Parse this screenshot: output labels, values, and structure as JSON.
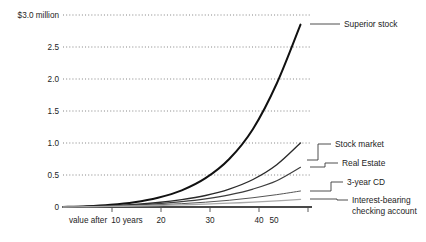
{
  "chart_data": {
    "type": "line",
    "title": "",
    "xlabel": "",
    "ylabel": "",
    "grid": "horizontal-dotted",
    "legend_position": "right-inline-labels",
    "xlim": [
      0,
      52
    ],
    "ylim": [
      0,
      3.0
    ],
    "y_ticks": [
      0,
      0.5,
      1.0,
      1.5,
      2.0,
      2.5,
      3.0
    ],
    "y_tick_labels": [
      "0",
      "0.5",
      "1.0",
      "1.5",
      "2.0",
      "2.5",
      "$3.0 million"
    ],
    "y_unit": "million dollars",
    "x_ticks": [
      10,
      20,
      30,
      40,
      50
    ],
    "x_tick_labels": [
      "10 years",
      "20",
      "30",
      "40",
      "50"
    ],
    "x_first_label_prefix": "value after",
    "x_unit": "years",
    "x": [
      0,
      5,
      10,
      15,
      20,
      25,
      30,
      35,
      40,
      45,
      50
    ],
    "series": [
      {
        "name": "Superior stock",
        "values": [
          0,
          0.012,
          0.035,
          0.075,
          0.145,
          0.26,
          0.45,
          0.75,
          1.22,
          1.93,
          2.85
        ],
        "color": "#111111",
        "width": 2.0
      },
      {
        "name": "Stock market",
        "values": [
          0,
          0.008,
          0.02,
          0.04,
          0.07,
          0.115,
          0.18,
          0.28,
          0.43,
          0.66,
          1.0
        ],
        "color": "#2a2a2a",
        "width": 1.35
      },
      {
        "name": "Real Estate",
        "values": [
          0,
          0.006,
          0.016,
          0.031,
          0.053,
          0.084,
          0.128,
          0.19,
          0.28,
          0.41,
          0.62
        ],
        "color": "#3d3d3d",
        "width": 1.15
      },
      {
        "name": "3-year CD",
        "values": [
          0,
          0.005,
          0.012,
          0.022,
          0.035,
          0.052,
          0.075,
          0.105,
          0.145,
          0.193,
          0.25
        ],
        "color": "#555555",
        "width": 1.0
      },
      {
        "name": "Interest-bearing checking account",
        "values": [
          0,
          0.004,
          0.009,
          0.016,
          0.024,
          0.034,
          0.046,
          0.06,
          0.076,
          0.096,
          0.12
        ],
        "color": "#a9a9a9",
        "width": 1.35
      }
    ],
    "annotations": []
  },
  "labels": {
    "superior_stock": "Superior stock",
    "stock_market": "Stock market",
    "real_estate": "Real Estate",
    "cd": "3-year CD",
    "checking_line1": "Interest-bearing",
    "checking_line2": "checking account"
  },
  "y_axis": {
    "t0": "0",
    "t1": "0.5",
    "t2": "1.0",
    "t3": "1.5",
    "t4": "2.0",
    "t5": "2.5",
    "t6": "$3.0 million"
  },
  "x_axis": {
    "t10_prefix": "value after",
    "t10": "10 years",
    "t20": "20",
    "t30": "30",
    "t40": "40",
    "t50": "50"
  }
}
